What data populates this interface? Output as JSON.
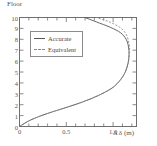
{
  "chart_data": {
    "type": "line",
    "title": "",
    "subtitle": "",
    "ylabel": "Floor",
    "xlabel": "Δ δ (m)",
    "xlim": [
      0,
      1.25
    ],
    "ylim": [
      0,
      10
    ],
    "xticks": [
      0,
      0.5,
      1.0
    ],
    "xticklabels": [
      "0",
      "0.5",
      "1.0"
    ],
    "xminor_step": 0.1,
    "yticks": [
      0,
      1,
      2,
      3,
      4,
      5,
      6,
      7,
      8,
      9,
      10
    ],
    "yticklabels": [
      "0",
      "1",
      "2",
      "3",
      "4",
      "5",
      "6",
      "7",
      "8",
      "9",
      "10"
    ],
    "grid": false,
    "legend_position": "upper-left-inside",
    "axis_ticks_all_sides": true,
    "series": [
      {
        "name": "Accurate",
        "style": "solid",
        "color": "#555555",
        "x": [
          0.0,
          0.12,
          0.3,
          0.52,
          0.72,
          0.88,
          1.0,
          1.08,
          1.13,
          1.16,
          1.17,
          1.165,
          1.14,
          1.08,
          0.97,
          0.82,
          0.7
        ],
        "y": [
          0.0,
          0.6,
          1.2,
          1.8,
          2.4,
          3.0,
          3.6,
          4.3,
          5.0,
          5.8,
          6.6,
          7.3,
          8.0,
          8.6,
          9.1,
          9.6,
          10.0
        ]
      },
      {
        "name": "Equivalent",
        "style": "dashed",
        "color": "#8a8a8a",
        "x": [
          0.0,
          0.12,
          0.3,
          0.52,
          0.72,
          0.88,
          1.0,
          1.08,
          1.13,
          1.16,
          1.175,
          1.175,
          1.16,
          1.13,
          1.07,
          0.96,
          0.82
        ],
        "y": [
          0.0,
          0.6,
          1.2,
          1.8,
          2.4,
          3.0,
          3.6,
          4.3,
          5.0,
          5.8,
          6.6,
          7.3,
          8.0,
          8.6,
          9.1,
          9.6,
          10.0
        ]
      }
    ],
    "legend": [
      {
        "label": "Accurate",
        "style": "solid"
      },
      {
        "label": "Equivalent",
        "style": "dashed"
      }
    ]
  }
}
